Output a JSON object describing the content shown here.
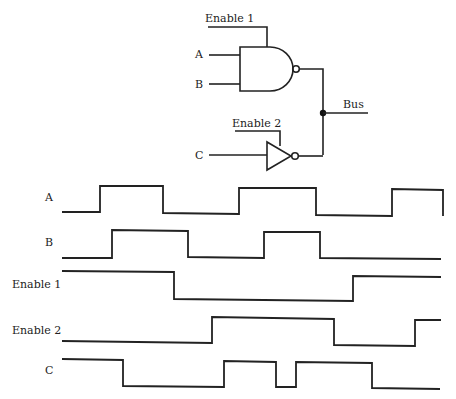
{
  "circuit": {
    "labels": {
      "enable1": "Enable 1",
      "enable2": "Enable 2",
      "a": "A",
      "b": "B",
      "c": "C",
      "bus": "Bus"
    },
    "gates": [
      {
        "type": "NAND",
        "inputs": [
          "A",
          "B"
        ],
        "enable": "Enable 1"
      },
      {
        "type": "NOT (tri-state inverter)",
        "inputs": [
          "C"
        ],
        "enable": "Enable 2"
      }
    ],
    "output": "Bus"
  },
  "timing": {
    "signals": [
      {
        "name": "A",
        "label": "A",
        "points": "62,212 100,212 100,186 163,186 163,213 239,214 239,188 316,188 316,215 392,216 392,189 443,190 443,216"
      },
      {
        "name": "B",
        "label": "B",
        "points": "62,258 112,258 112,230 188,231 188,257 264,258 264,232 320,232 320,258 441,259"
      },
      {
        "name": "Enable 1",
        "label": "Enable 1",
        "points": "62,271 174,272 174,299 353,301 353,276 441,277"
      },
      {
        "name": "Enable 2",
        "label": "Enable 2",
        "points": "62,341 212,343 212,317 334,319 334,345 415,346 415,320 441,320"
      },
      {
        "name": "C",
        "label": "C",
        "points": "62,359 123,360 123,386 224,387 224,361 276,362 276,387 296,387 296,362 372,363 372,388 440,389"
      }
    ]
  }
}
